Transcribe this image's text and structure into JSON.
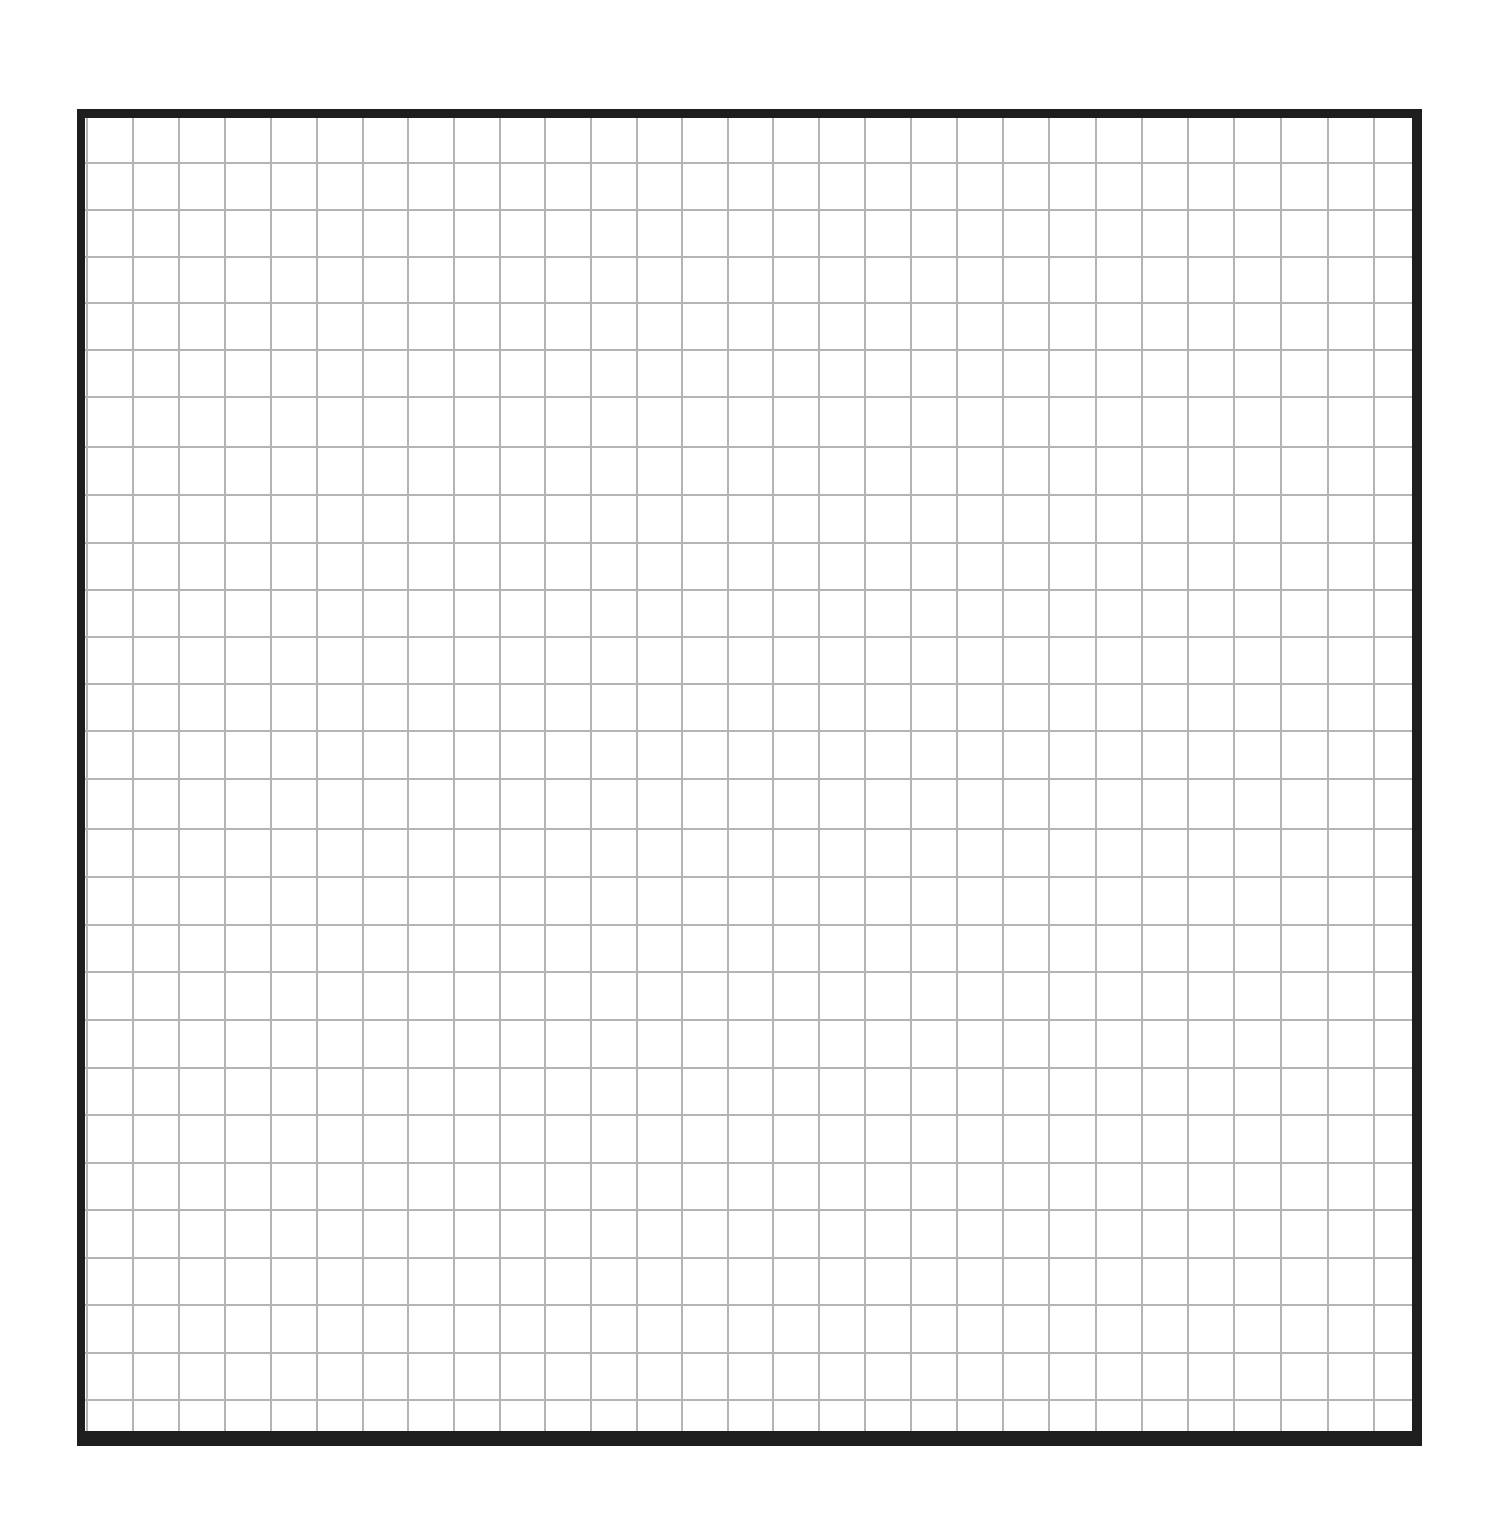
{
  "sheet": {
    "type": "graph-paper",
    "frame_color": "#1e1e1e",
    "grid_color": "#b4b4b4",
    "columns": 30,
    "rows": 28,
    "vertical_lines_x": [
      87,
      133,
      179,
      225,
      271,
      317,
      363,
      408,
      454,
      500,
      545,
      591,
      637,
      682,
      728,
      773,
      819,
      865,
      911,
      957,
      1003,
      1049,
      1096,
      1142,
      1188,
      1234,
      1281,
      1328,
      1374
    ],
    "horizontal_lines_y": [
      163,
      210,
      257,
      303,
      350,
      397,
      447,
      495,
      543,
      590,
      637,
      684,
      731,
      779,
      829,
      877,
      925,
      972,
      1020,
      1068,
      1115,
      1163,
      1210,
      1258,
      1305,
      1353,
      1400
    ]
  }
}
